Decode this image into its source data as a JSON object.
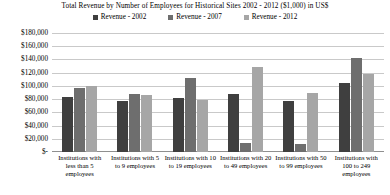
{
  "chart_data": {
    "type": "bar",
    "title": "Total Revenue by Number of Employees for Historical Sites 2002 - 2012 ($1,000) in US$",
    "xlabel": "",
    "ylabel": "",
    "grid": true,
    "legend_position": "top",
    "ylim": [
      0,
      180000
    ],
    "ytick_values": [
      180000,
      160000,
      140000,
      120000,
      100000,
      80000,
      60000,
      40000,
      20000,
      0
    ],
    "ytick_labels": [
      "$180,000",
      "$160,000",
      "$140,000",
      "$120,000",
      "$100,000",
      "$80,000",
      "$60,000",
      "$40,000",
      "$20,000",
      "$-"
    ],
    "categories": [
      "Institutions with less than 5 employees",
      "Institutions with 5 to 9 employees",
      "Institutions with 10 to 19 employees",
      "Institutions with 20 to 49 employees",
      "Institutions with 50 to 99 employees",
      "Institutions with 100 to 249 employees"
    ],
    "series": [
      {
        "name": "Revenue - 2002",
        "color": "#3f3f3f",
        "values": [
          83000,
          77000,
          82000,
          88000,
          77000,
          105000
        ]
      },
      {
        "name": "Revenue - 2007",
        "color": "#6e6e6e",
        "values": [
          97000,
          88000,
          112000,
          14000,
          12000,
          142000
        ]
      },
      {
        "name": "Revenue - 2012",
        "color": "#a6a6a6",
        "values": [
          100000,
          86000,
          79000,
          129000,
          89000,
          118000
        ]
      }
    ]
  }
}
